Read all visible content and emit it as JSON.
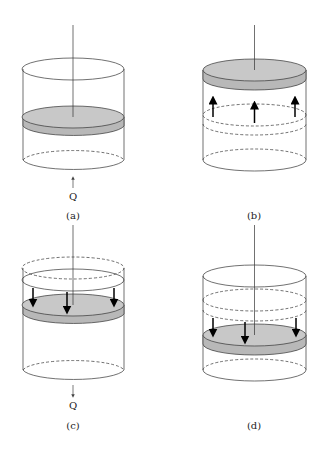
{
  "figure": {
    "panels": [
      {
        "id": "a",
        "label": "(a)",
        "heat_label": "Q",
        "heat_direction": "in"
      },
      {
        "id": "b",
        "label": "(b)",
        "motion": "piston-up"
      },
      {
        "id": "c",
        "label": "(c)",
        "heat_label": "Q",
        "heat_direction": "out"
      },
      {
        "id": "d",
        "label": "(d)",
        "motion": "piston-down"
      }
    ]
  },
  "colors": {
    "piston": "#c8c8c8",
    "line": "#333333"
  }
}
